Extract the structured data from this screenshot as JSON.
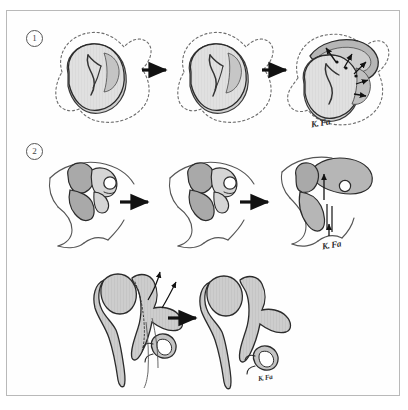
{
  "figure": {
    "background_color": "#ffffff",
    "border_color": "#b9b9b9",
    "ink_color": "#2b2b2b",
    "fill_light": "#e2e2e2",
    "fill_mid": "#c9c9c9",
    "fill_dark": "#b0b0b0",
    "width": 408,
    "height": 410
  },
  "rows": [
    {
      "id": "row-1",
      "number_label": "1",
      "caption": "Auricular hillock stage — dashed outline of surface contour with shaded auricle primordium",
      "signature": "K. Fa",
      "arrows": 2,
      "panels": [
        {
          "id": "r1-p1",
          "name": "stage-1-early-auricle"
        },
        {
          "id": "r1-p2",
          "name": "stage-2-mid-auricle"
        },
        {
          "id": "r1-p3",
          "name": "stage-3-late-auricle-with-growth-arrows"
        }
      ]
    },
    {
      "id": "row-2",
      "number_label": "2",
      "caption": "Lateral profile series — migration of the external ear along the head contour",
      "signature": "K. Fa",
      "arrows": 2,
      "panels": [
        {
          "id": "r2-p1",
          "name": "profile-stage-1"
        },
        {
          "id": "r2-p2",
          "name": "profile-stage-2"
        },
        {
          "id": "r2-p3",
          "name": "profile-stage-3-with-migration-arrows"
        }
      ]
    },
    {
      "id": "row-3",
      "number_label": "",
      "caption": "Ossicular chain — malleus, incus and stapes before and after separation",
      "signature": "K. Fa",
      "arrows": 1,
      "panels": [
        {
          "id": "r3-p1",
          "name": "ossicles-attached-with-arrows"
        },
        {
          "id": "r3-p2",
          "name": "ossicles-separated"
        }
      ]
    }
  ],
  "signatures": [
    {
      "id": "sig-1",
      "text": "K. Fa"
    },
    {
      "id": "sig-2",
      "text": "K. Fa"
    },
    {
      "id": "sig-3",
      "text": "K. Fa"
    }
  ],
  "arrow_color": "#111111"
}
